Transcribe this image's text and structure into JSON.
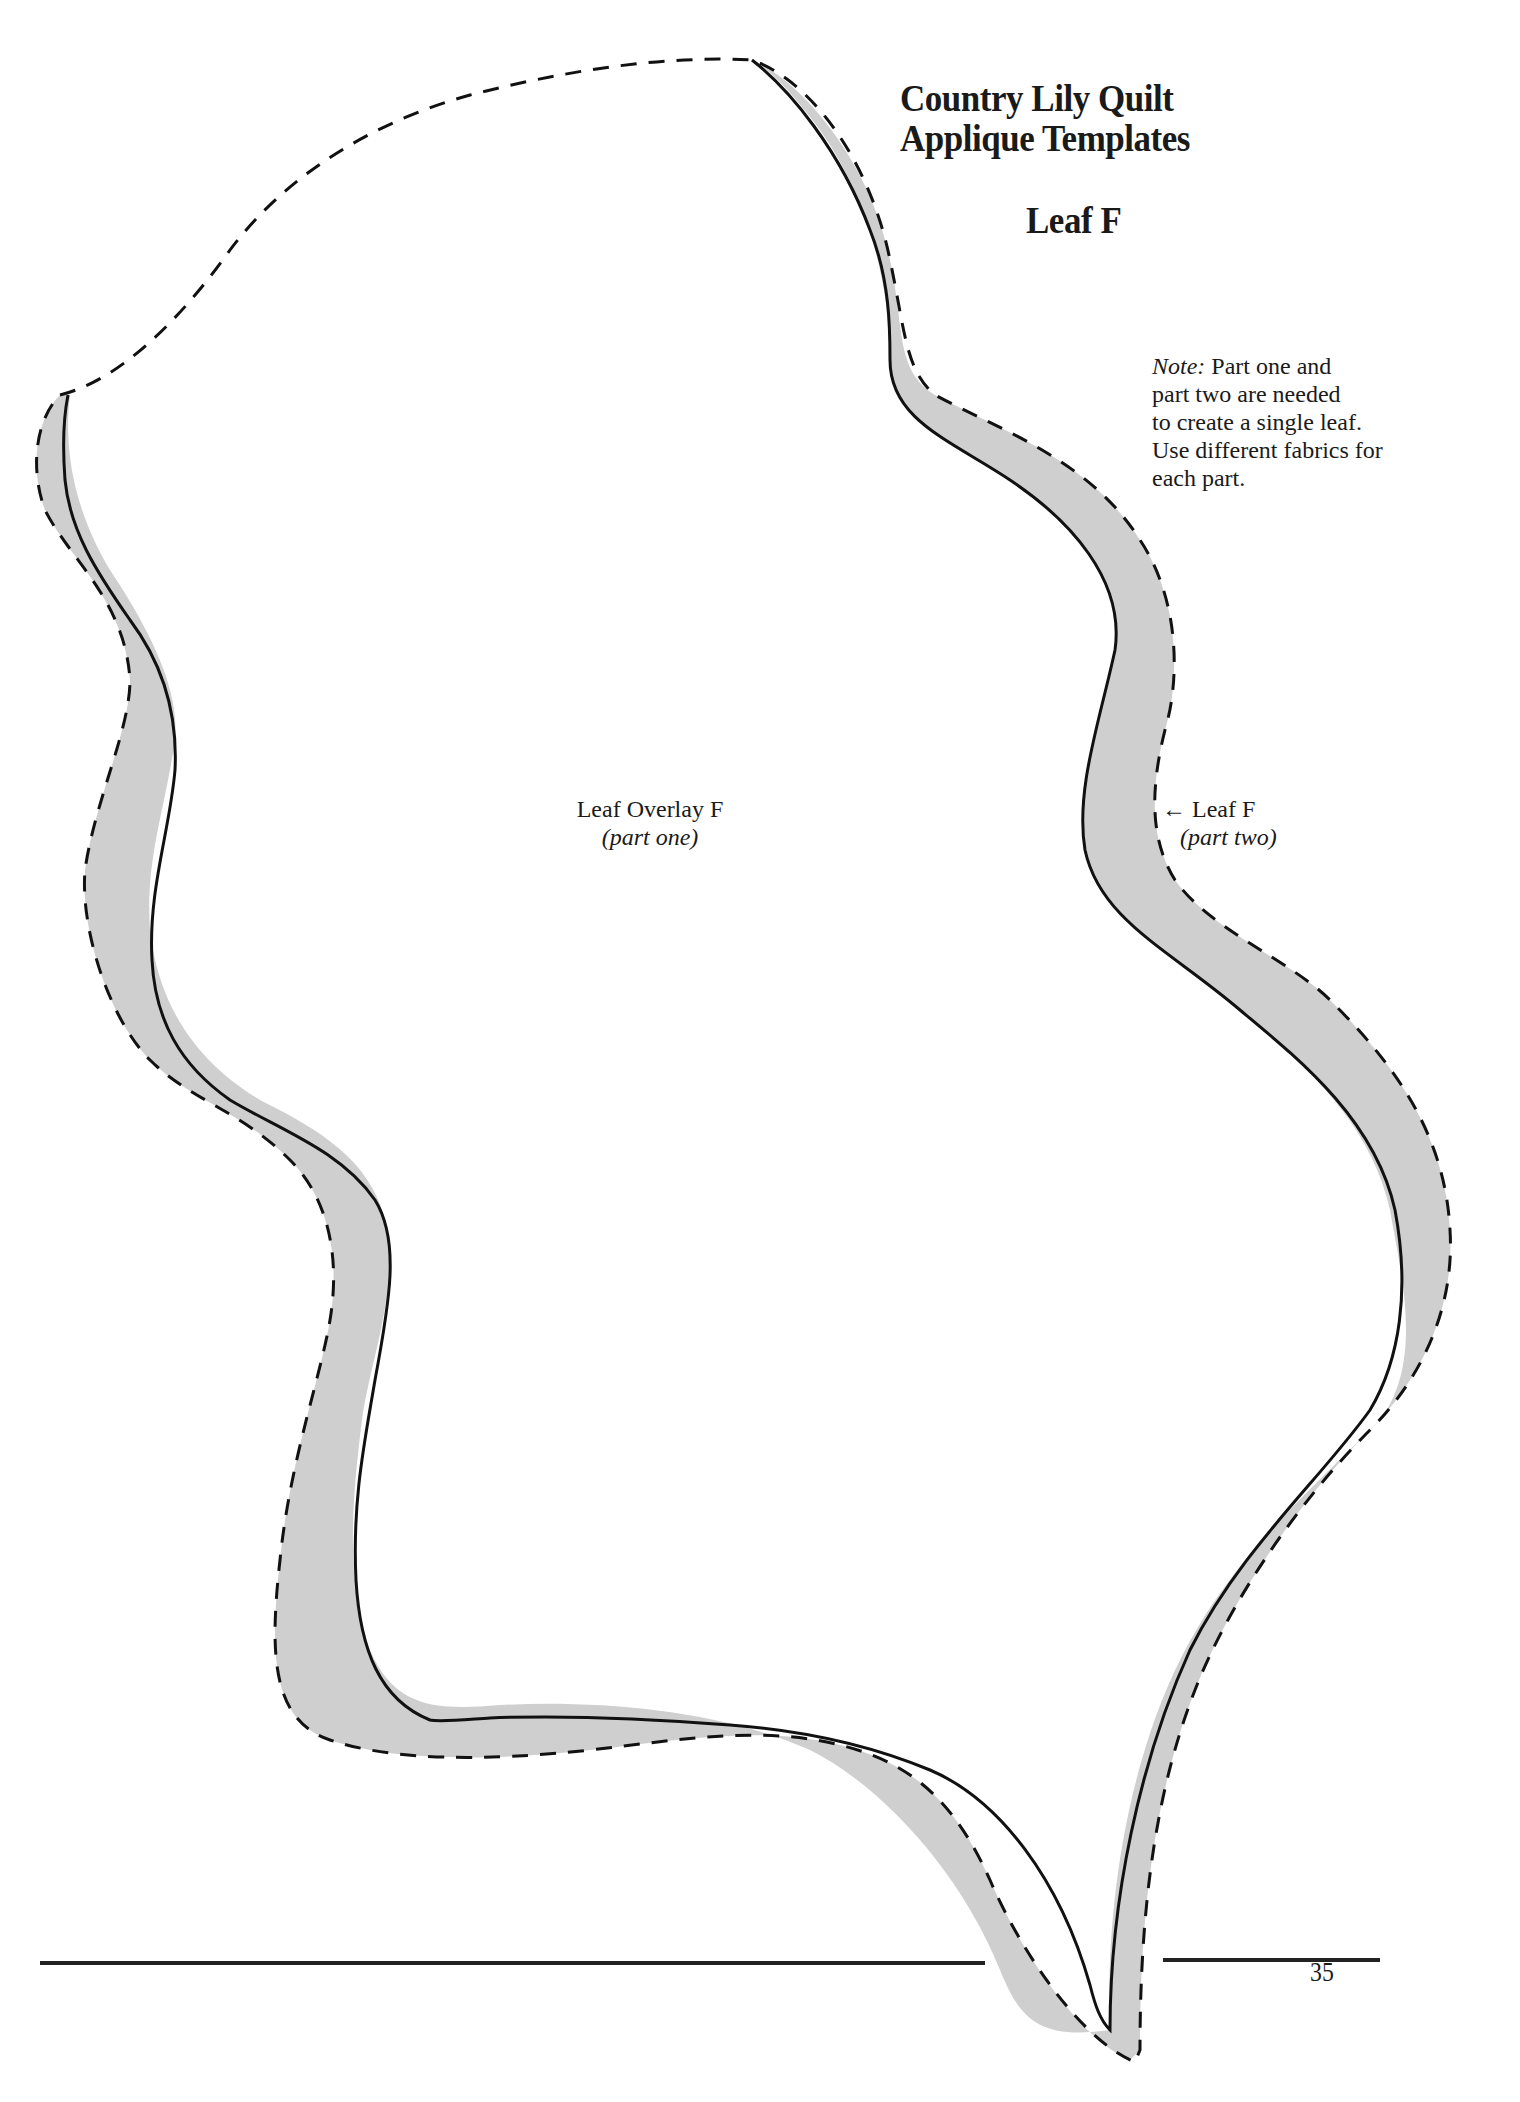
{
  "document": {
    "title_lines": [
      "Country Lily Quilt",
      "Applique Templates"
    ],
    "subtitle": "Leaf F",
    "note": {
      "label": "Note:",
      "text_lines": [
        " Part one and",
        "part two are needed",
        "to create a single leaf.",
        "Use different fabrics for",
        "each part."
      ]
    },
    "part_one": {
      "name": "Leaf Overlay F",
      "part": "(part one)"
    },
    "part_two": {
      "arrow": "←",
      "name": "Leaf F",
      "part": "(part two)"
    },
    "page_number": "35"
  },
  "colors": {
    "fill_band": "#cfcfcf",
    "outline": "#111111",
    "background": "#ffffff"
  },
  "template": {
    "solid_line_meaning": "Leaf Overlay F outline (part one)",
    "dashed_line_meaning": "Leaf F outline (part two)"
  }
}
